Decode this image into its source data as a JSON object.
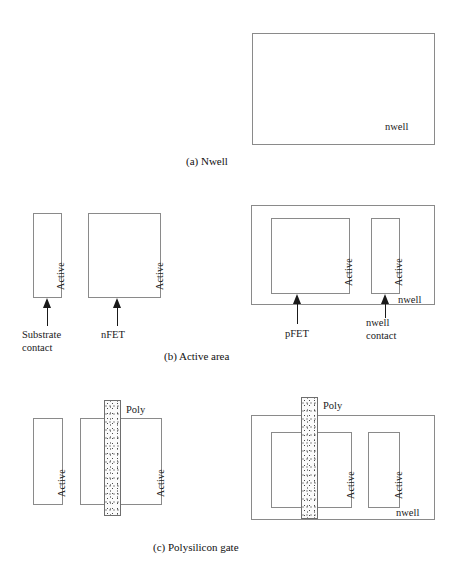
{
  "figure": {
    "panels": [
      {
        "id": "a",
        "caption": "(a)  Nwell",
        "labels": {
          "nwell": "nwell"
        }
      },
      {
        "id": "b",
        "caption": "(b)  Active area",
        "labels": {
          "active": "Active",
          "substrate_contact": "Substrate contact",
          "nfet": "nFET",
          "pfet": "pFET",
          "nwell_contact": "nwell contact",
          "nwell": "nwell"
        }
      },
      {
        "id": "c",
        "caption": "(c)  Polysilicon gate",
        "labels": {
          "active": "Active",
          "poly": "Poly",
          "nwell": "nwell"
        }
      }
    ]
  },
  "colors": {
    "outline": "#8a8a8a",
    "poly_outline": "#6e6e6e",
    "text": "#1a1a1a",
    "background": "#ffffff"
  }
}
